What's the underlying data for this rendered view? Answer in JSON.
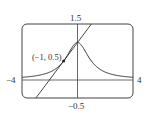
{
  "chart_data": {
    "type": "line",
    "title": "",
    "xlabel": "",
    "ylabel": "",
    "xlim": [
      -4,
      4
    ],
    "ylim": [
      -0.5,
      1.5
    ],
    "grid": false,
    "series": [
      {
        "name": "curve",
        "function": "y = 1/(1+x^2)",
        "x": [
          -4,
          -3,
          -2,
          -1,
          -0.5,
          0,
          0.5,
          1,
          2,
          3,
          4
        ],
        "values": [
          0.059,
          0.1,
          0.2,
          0.5,
          0.8,
          1,
          0.8,
          0.5,
          0.2,
          0.1,
          0.059
        ]
      },
      {
        "name": "tangent line",
        "function": "y = 0.5x + 1",
        "x": [
          -3,
          1
        ],
        "values": [
          -0.5,
          1.5
        ]
      }
    ],
    "annotations": [
      {
        "text": "(−1, 0.5)",
        "x": -1,
        "y": 0.5
      }
    ],
    "tick_labels": {
      "ymax": "1.5",
      "ymin": "−0.5",
      "xmin": "−4",
      "xmax": "4"
    }
  },
  "labels": {
    "ymax": "1.5",
    "ymin": "−0.5",
    "xmin": "−4",
    "xmax": "4",
    "point": "(−1, 0.5)"
  },
  "colors": {
    "stroke": "#333333"
  }
}
